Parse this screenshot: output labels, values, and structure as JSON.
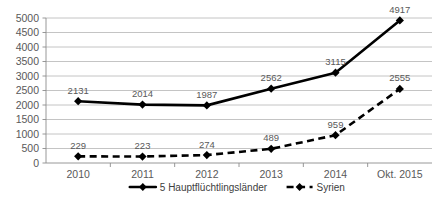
{
  "chart_data": {
    "type": "line",
    "title": "",
    "subtitle": "",
    "xlabel": "",
    "ylabel": "",
    "categories": [
      "2010",
      "2011",
      "2012",
      "2013",
      "2014",
      "Okt. 2015"
    ],
    "ylim": [
      0,
      5000
    ],
    "ytick_labels": [
      "5000",
      "4500",
      "4000",
      "3500",
      "3000",
      "2500",
      "2000",
      "1500",
      "1000",
      "500",
      "0"
    ],
    "ytick_values": [
      5000,
      4500,
      4000,
      3500,
      3000,
      2500,
      2000,
      1500,
      1000,
      500,
      0
    ],
    "grid": true,
    "legend_position": "bottom",
    "series": [
      {
        "name": "5 Hauptflüchtlingsländer",
        "style": "solid",
        "marker": "diamond",
        "color": "#000000",
        "values": [
          2131,
          2014,
          1987,
          2562,
          3115,
          4917
        ],
        "labels": [
          "2131",
          "2014",
          "1987",
          "2562",
          "3115",
          "4917"
        ]
      },
      {
        "name": "Syrien",
        "style": "dashed",
        "marker": "diamond",
        "color": "#000000",
        "values": [
          229,
          223,
          274,
          489,
          959,
          2555
        ],
        "labels": [
          "229",
          "223",
          "274",
          "489",
          "959",
          "2555"
        ]
      }
    ]
  },
  "legend": {
    "entries": [
      {
        "label": "5 Hauptflüchtlingsländer"
      },
      {
        "label": "Syrien"
      }
    ]
  },
  "colors": {
    "series": "#000000",
    "grid": "#b5b5b5",
    "axis": "#8c8c8c",
    "label_text": "#595959",
    "background": "#ffffff"
  }
}
